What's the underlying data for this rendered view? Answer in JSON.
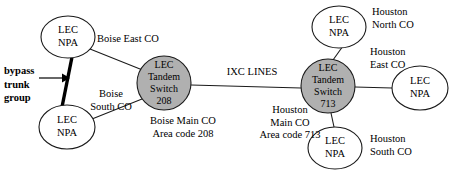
{
  "diagram": {
    "colors": {
      "tandem_fill": "#b0b0b0",
      "node_fill": "#ffffff",
      "stroke": "#1a1a1a",
      "background": "#ffffff"
    },
    "nodes": [
      {
        "id": "boise-east-co",
        "line1": "LEC",
        "line2": "NPA",
        "type": "lec-npa",
        "cx": 68,
        "cy": 37,
        "rx": 27,
        "ry": 21
      },
      {
        "id": "boise-south-co",
        "line1": "LEC",
        "line2": "NPA",
        "type": "lec-npa",
        "cx": 67,
        "cy": 127,
        "rx": 28,
        "ry": 22
      },
      {
        "id": "boise-tandem",
        "line1": "LEC",
        "line2": "Tandem",
        "line3": "Switch",
        "line4": "208",
        "type": "tandem",
        "cx": 164,
        "cy": 83,
        "rx": 27,
        "ry": 27
      },
      {
        "id": "houston-tandem",
        "line1": "LEC",
        "line2": "Tandem",
        "line3": "Switch",
        "line4": "713",
        "type": "tandem",
        "cx": 328,
        "cy": 86,
        "rx": 27,
        "ry": 27
      },
      {
        "id": "houston-north-co",
        "line1": "LEC",
        "line2": "NPA",
        "type": "lec-npa",
        "cx": 339,
        "cy": 27,
        "rx": 27,
        "ry": 21
      },
      {
        "id": "houston-east-co",
        "line1": "LEC",
        "line2": "NPA",
        "type": "lec-npa",
        "cx": 420,
        "cy": 88,
        "rx": 28,
        "ry": 22
      },
      {
        "id": "houston-south-co",
        "line1": "LEC",
        "line2": "NPA",
        "type": "lec-npa",
        "cx": 335,
        "cy": 148,
        "rx": 27,
        "ry": 21
      }
    ],
    "labels": {
      "boise_east_co": "Boise East CO",
      "boise_south_co": "Boise\nSouth CO",
      "boise_main_co": "Boise Main CO\nArea code 208",
      "ixc_lines": "IXC LINES",
      "houston_main_co": "Houston\nMain CO\nArea code 713",
      "houston_north_co": "Houston\nNorth CO",
      "houston_east_co": "Houston\nEast CO",
      "houston_south_co": "Houston\nSouth CO",
      "bypass_trunk_group": "bypass\ntrunk\ngroup"
    },
    "edges": [
      {
        "id": "boise-east-to-tandem",
        "from": "boise-east-co",
        "to": "boise-tandem",
        "style": "thin"
      },
      {
        "id": "boise-south-to-tandem",
        "from": "boise-south-co",
        "to": "boise-tandem",
        "style": "thin"
      },
      {
        "id": "bypass-trunk",
        "from": "boise-east-co",
        "to": "boise-south-co",
        "style": "thick"
      },
      {
        "id": "ixc-lines",
        "from": "boise-tandem",
        "to": "houston-tandem",
        "style": "thin"
      },
      {
        "id": "houston-north-to-tandem",
        "from": "houston-north-co",
        "to": "houston-tandem",
        "style": "thin"
      },
      {
        "id": "houston-east-to-tandem",
        "from": "houston-east-co",
        "to": "houston-tandem",
        "style": "thin"
      },
      {
        "id": "houston-south-to-tandem",
        "from": "houston-south-co",
        "to": "houston-tandem",
        "style": "thin"
      }
    ]
  }
}
